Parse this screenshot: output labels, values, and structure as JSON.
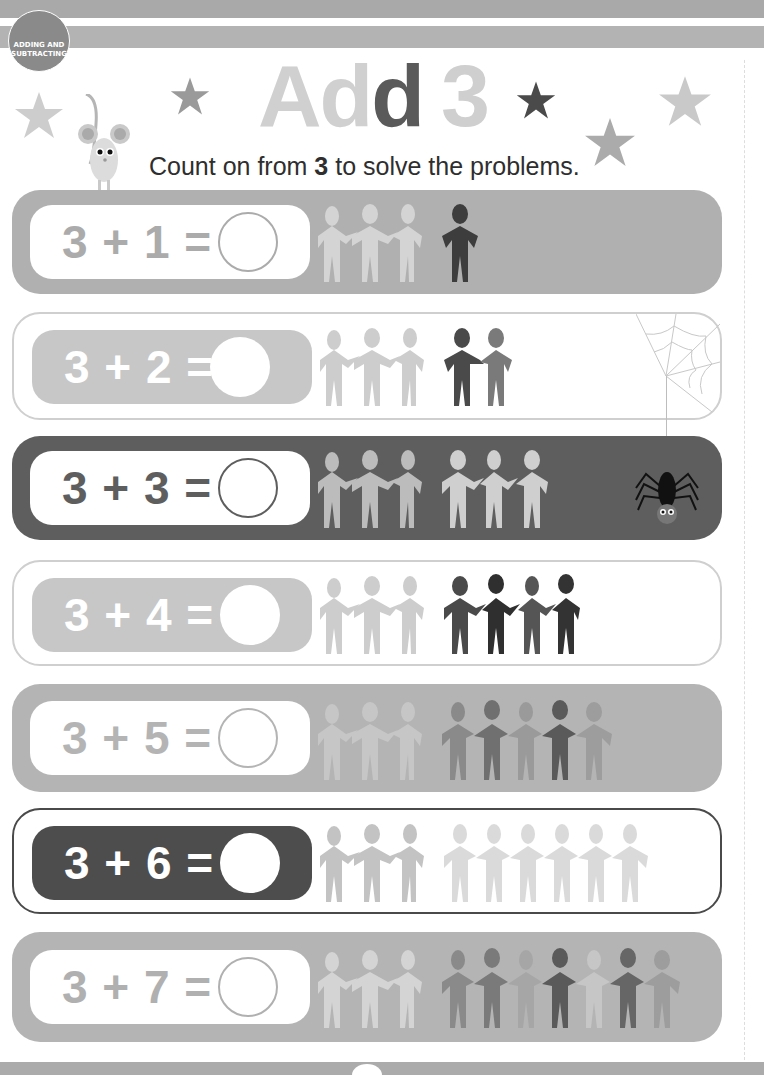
{
  "header": {
    "section_badge": "ADDING AND SUBTRACTING",
    "title_part1": "Ad",
    "title_part2": "d",
    "title_number": "3",
    "instruction_pre": "Count on from ",
    "instruction_bold": "3",
    "instruction_post": " to solve the problems."
  },
  "colors": {
    "band": "#a9a9a9",
    "row_light": "#b0b0b0",
    "row_dark": "#5e5e5e",
    "row_outline_light": "#cfcfcf",
    "row_outline_dark": "#4a4a4a",
    "figure_light": "#cdcdcd",
    "figure_dark": "#3d3d3d"
  },
  "problems": [
    {
      "equation": "3 + 1 =",
      "base": 3,
      "add": 1,
      "answer": ""
    },
    {
      "equation": "3 + 2 =",
      "base": 3,
      "add": 2,
      "answer": ""
    },
    {
      "equation": "3 + 3 =",
      "base": 3,
      "add": 3,
      "answer": ""
    },
    {
      "equation": "3 + 4 =",
      "base": 3,
      "add": 4,
      "answer": ""
    },
    {
      "equation": "3 + 5 =",
      "base": 3,
      "add": 5,
      "answer": ""
    },
    {
      "equation": "3 + 6 =",
      "base": 3,
      "add": 6,
      "answer": ""
    },
    {
      "equation": "3 + 7 =",
      "base": 3,
      "add": 7,
      "answer": ""
    }
  ],
  "decorations": {
    "icons": [
      "star-icon",
      "mouse-icon",
      "spider-icon",
      "spiderweb-icon",
      "paper-person-icon"
    ]
  }
}
